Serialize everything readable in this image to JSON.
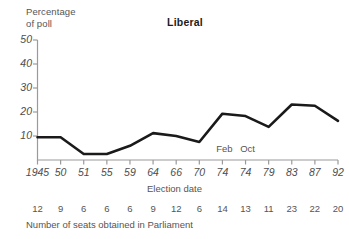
{
  "chart_data": {
    "type": "line",
    "title": "Liberal",
    "ylabel": "Percentage\nof poll",
    "xlabel": "Election date",
    "categories": [
      "1945",
      "50",
      "51",
      "55",
      "59",
      "64",
      "66",
      "70",
      "74",
      "74",
      "79",
      "83",
      "87",
      "92"
    ],
    "values": [
      9.5,
      9.5,
      2.5,
      2.5,
      5.9,
      11.2,
      10.0,
      7.5,
      19.3,
      18.3,
      13.8,
      23.1,
      22.6,
      16.3
    ],
    "ylim": [
      0,
      50
    ],
    "yticks": [
      "50",
      "40",
      "30",
      "20",
      "10"
    ],
    "ytick_values": [
      50,
      40,
      30,
      20,
      10
    ],
    "grid": false,
    "legend": "none",
    "line_color": "#1a1a1a",
    "axis_color": "#9a9a9a",
    "annotations": [
      {
        "text": "Feb",
        "at_index": 8
      },
      {
        "text": "Oct",
        "at_index": 9
      }
    ],
    "secondary_axis": {
      "caption": "Number of seats obtained in Parliament",
      "values": [
        "12",
        "9",
        "6",
        "6",
        "6",
        "9",
        "12",
        "6",
        "14",
        "13",
        "11",
        "23",
        "22",
        "20"
      ]
    }
  }
}
